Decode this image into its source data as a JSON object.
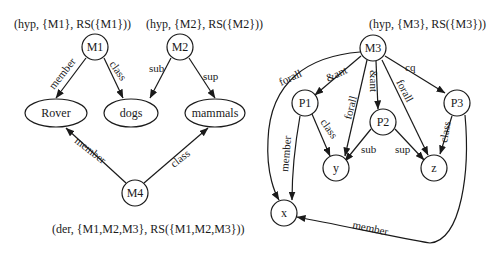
{
  "annotations": {
    "m1": "(hyp, {M1}, RS({M1}))",
    "m2": "(hyp, {M2}, RS({M2}))",
    "m3": "(hyp, {M3}, RS({M3}))",
    "m4": "(der, {M1,M2,M3}, RS({M1,M2,M3}))"
  },
  "nodes": {
    "M1": "M1",
    "M2": "M2",
    "M3": "M3",
    "M4": "M4",
    "Rover": "Rover",
    "dogs": "dogs",
    "mammals": "mammals",
    "P1": "P1",
    "P2": "P2",
    "P3": "P3",
    "x": "x",
    "y": "y",
    "z": "z"
  },
  "edges": {
    "m1_member": "member",
    "m1_class": "class",
    "m2_sub": "sub",
    "m2_sup": "sup",
    "m4_member": "member",
    "m4_class": "class",
    "m3_forall_x": "forall",
    "m3_ant_p1": "&ant",
    "m3_forall_y": "forall",
    "m3_ant_p2": "&ant",
    "m3_forall_z": "forall",
    "m3_cq_p3": "cq",
    "p1_member": "member",
    "p1_class": "class",
    "p2_sub": "sub",
    "p2_sup": "sup",
    "p3_class": "class",
    "p3_member": "member"
  }
}
